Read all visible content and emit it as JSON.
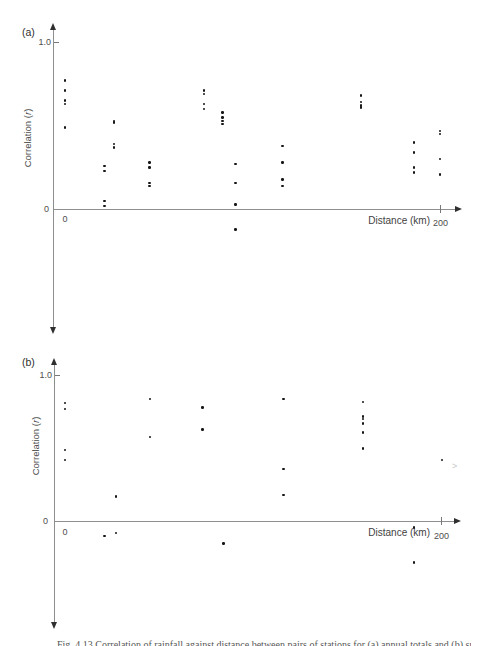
{
  "figure": {
    "artifact_mark": ">",
    "caption": "Fig. 4.13 Correlation of rainfall against distance between pairs of stations for (a) annual totals and (b) summer totals."
  },
  "chart_data": [
    {
      "type": "scatter",
      "panel_label": "(a)",
      "title": "",
      "xlabel": "Distance (km)",
      "ylabel": "Correlation (r)",
      "ylabel_prefix": "Correlation (",
      "ylabel_italic": "r",
      "ylabel_suffix": ")",
      "xlim": [
        0,
        208
      ],
      "ylim": [
        -0.72,
        1.1
      ],
      "grid": false,
      "marker_color": "#161616",
      "xticks": [
        {
          "value": 0,
          "label": "0"
        },
        {
          "value": 200,
          "label": "200"
        }
      ],
      "yticks": [
        {
          "value": 1.0,
          "label": "1.0"
        },
        {
          "value": 0,
          "label": "0"
        }
      ],
      "points": [
        [
          0,
          0.77
        ],
        [
          0,
          0.71
        ],
        [
          0,
          0.65
        ],
        [
          0,
          0.63
        ],
        [
          0,
          0.49
        ],
        [
          21,
          0.26
        ],
        [
          21,
          0.23
        ],
        [
          21,
          0.05
        ],
        [
          21,
          0.02
        ],
        [
          26,
          0.53
        ],
        [
          26,
          0.52
        ],
        [
          26,
          0.39
        ],
        [
          26,
          0.37
        ],
        [
          45,
          0.28
        ],
        [
          45,
          0.25
        ],
        [
          45,
          0.16
        ],
        [
          45,
          0.14
        ],
        [
          74,
          0.71
        ],
        [
          74,
          0.69
        ],
        [
          74,
          0.63
        ],
        [
          74,
          0.6
        ],
        [
          84,
          0.58
        ],
        [
          84,
          0.55
        ],
        [
          84,
          0.53
        ],
        [
          84,
          0.51
        ],
        [
          91,
          0.27
        ],
        [
          91,
          0.16
        ],
        [
          91,
          0.03
        ],
        [
          91,
          -0.12
        ],
        [
          116,
          0.38
        ],
        [
          116,
          0.28
        ],
        [
          116,
          0.18
        ],
        [
          116,
          0.14
        ],
        [
          158,
          0.68
        ],
        [
          158,
          0.64
        ],
        [
          158,
          0.62
        ],
        [
          158,
          0.61
        ],
        [
          186,
          0.4
        ],
        [
          186,
          0.34
        ],
        [
          186,
          0.25
        ],
        [
          186,
          0.22
        ],
        [
          200,
          0.47
        ],
        [
          200,
          0.45
        ],
        [
          200,
          0.3
        ],
        [
          200,
          0.21
        ]
      ]
    },
    {
      "type": "scatter",
      "panel_label": "(b)",
      "title": "",
      "xlabel": "Distance (km)",
      "ylabel": "Correlation (r)",
      "ylabel_prefix": "Correlation (",
      "ylabel_italic": "r",
      "ylabel_suffix": ")",
      "xlim": [
        0,
        208
      ],
      "ylim": [
        -0.71,
        1.1
      ],
      "grid": false,
      "marker_color": "#161616",
      "xticks": [
        {
          "value": 0,
          "label": "0"
        },
        {
          "value": 200,
          "label": "200"
        }
      ],
      "yticks": [
        {
          "value": 1.0,
          "label": "1.0"
        },
        {
          "value": 0,
          "label": "0"
        }
      ],
      "points": [
        [
          0,
          0.81
        ],
        [
          0,
          0.77
        ],
        [
          0,
          0.49
        ],
        [
          0,
          0.42
        ],
        [
          21,
          -0.1
        ],
        [
          27,
          0.17
        ],
        [
          27,
          -0.08
        ],
        [
          45,
          0.84
        ],
        [
          45,
          0.58
        ],
        [
          73,
          0.78
        ],
        [
          73,
          0.63
        ],
        [
          84,
          -0.15
        ],
        [
          116,
          0.84
        ],
        [
          116,
          0.36
        ],
        [
          116,
          0.18
        ],
        [
          158,
          0.82
        ],
        [
          158,
          0.72
        ],
        [
          158,
          0.7
        ],
        [
          158,
          0.67
        ],
        [
          158,
          0.61
        ],
        [
          158,
          0.5
        ],
        [
          185,
          -0.04
        ],
        [
          185,
          -0.28
        ],
        [
          200,
          0.42
        ]
      ]
    }
  ]
}
